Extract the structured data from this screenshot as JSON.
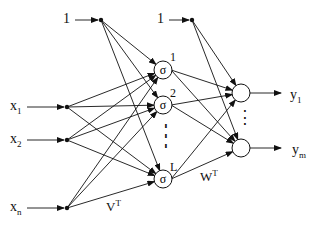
{
  "diagram": {
    "type": "two-layer neural network",
    "inputs": [
      {
        "label": "x",
        "sub": "1",
        "x": 67,
        "y": 107,
        "lx": 10,
        "ly": 99
      },
      {
        "label": "x",
        "sub": "2",
        "x": 67,
        "y": 140,
        "lx": 10,
        "ly": 132
      },
      {
        "label": "x",
        "sub": "n",
        "x": 67,
        "y": 208,
        "lx": 10,
        "ly": 200
      }
    ],
    "bias_left": {
      "label": "1",
      "x": 101,
      "y": 20,
      "lx": 63,
      "ly": 12
    },
    "bias_right": {
      "label": "1",
      "x": 192,
      "y": 20,
      "lx": 157,
      "ly": 12
    },
    "hidden": [
      {
        "label": "1",
        "symbol": "σ",
        "x": 163,
        "y": 70,
        "lx": 170,
        "ly": 50
      },
      {
        "label": "2",
        "symbol": "σ",
        "x": 163,
        "y": 105,
        "lx": 170,
        "ly": 86
      },
      {
        "label": "L",
        "symbol": "σ",
        "x": 163,
        "y": 179,
        "lx": 170,
        "ly": 160
      }
    ],
    "hidden_ellipsis": "⋮",
    "outputs": [
      {
        "label": "y",
        "sub": "1",
        "x": 241,
        "y": 93,
        "lx": 290,
        "ly": 88
      },
      {
        "label": "y",
        "sub": "m",
        "x": 241,
        "y": 148,
        "lx": 292,
        "ly": 143
      }
    ],
    "output_ellipsis": "⋮",
    "weight_labels": {
      "first_layer": {
        "text": "V",
        "sup": "T",
        "lx": 106,
        "ly": 196
      },
      "second_layer": {
        "text": "W",
        "sup": "T",
        "lx": 200,
        "ly": 166
      }
    }
  }
}
